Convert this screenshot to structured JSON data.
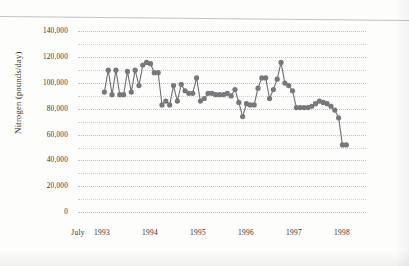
{
  "chart_data": {
    "type": "line",
    "title": "",
    "xlabel": "",
    "ylabel": "Nitrogen (pounds/day)",
    "ylim": [
      0,
      145000
    ],
    "yticks": [
      0,
      20000,
      40000,
      60000,
      80000,
      100000,
      120000,
      140000
    ],
    "ytick_labels": [
      "0",
      "20,000",
      "40,000",
      "60,000",
      "80,000",
      "100,000",
      "120,000",
      "140,000"
    ],
    "minor_gridlines": true,
    "minor_grid_step": 10000,
    "grid": true,
    "legend": "none",
    "xtick_labels": [
      "July",
      "1993",
      "1994",
      "1995",
      "1996",
      "1997",
      "1998"
    ],
    "xtick_positions": [
      0.0,
      0.5,
      1.5,
      2.5,
      3.5,
      4.5,
      5.5
    ],
    "x_unit": "half-year",
    "x": [
      0.55,
      0.63,
      0.71,
      0.79,
      0.87,
      0.95,
      1.03,
      1.11,
      1.19,
      1.27,
      1.35,
      1.43,
      1.51,
      1.59,
      1.67,
      1.75,
      1.83,
      1.91,
      1.99,
      2.07,
      2.15,
      2.23,
      2.31,
      2.39,
      2.47,
      2.55,
      2.63,
      2.71,
      2.79,
      2.87,
      2.95,
      3.03,
      3.11,
      3.19,
      3.27,
      3.35,
      3.43,
      3.51,
      3.59,
      3.67,
      3.75,
      3.83,
      3.91,
      3.99,
      4.07,
      4.15,
      4.23,
      4.31,
      4.39,
      4.47,
      4.55,
      4.63,
      4.71,
      4.79,
      4.87,
      4.95,
      5.03,
      5.11,
      5.19,
      5.27,
      5.35,
      5.43,
      5.51,
      5.59
    ],
    "values": [
      93000,
      110000,
      91000,
      110000,
      91000,
      91000,
      109000,
      93000,
      110000,
      98000,
      114000,
      116000,
      115000,
      108000,
      108000,
      83000,
      86000,
      83000,
      98000,
      86000,
      99000,
      94000,
      92000,
      92000,
      104000,
      86000,
      88000,
      92000,
      92000,
      91000,
      91000,
      91000,
      92000,
      90000,
      95000,
      85000,
      74000,
      84000,
      83000,
      83000,
      96000,
      104000,
      104000,
      88000,
      95000,
      103000,
      116000,
      100000,
      98000,
      94000,
      81000,
      81000,
      81000,
      81000,
      82000,
      84000,
      86000,
      85000,
      84000,
      82000,
      79000,
      73000,
      52000,
      52000
    ],
    "series_color": "#6f6f72",
    "marker": "circle",
    "marker_size": 2.6
  }
}
